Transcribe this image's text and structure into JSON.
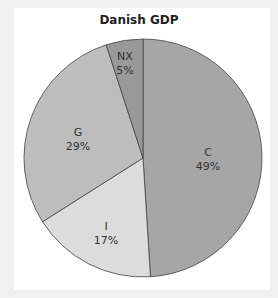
{
  "chart_data": {
    "type": "pie",
    "title": "Danish GDP",
    "categories": [
      "C",
      "I",
      "G",
      "NX"
    ],
    "values": [
      49,
      17,
      29,
      5
    ],
    "labels": [
      "C 49%",
      "I 17%",
      "G 29%",
      "NX 5%"
    ],
    "colors": {
      "C": "#a6a6a6",
      "I": "#dcdcdc",
      "G": "#bdbdbd",
      "NX": "#999999"
    },
    "start_angle": "12 o'clock, clockwise",
    "legend": "none (inline labels)"
  },
  "title": "Danish GDP",
  "slices": [
    {
      "name": "C",
      "pct": "49%"
    },
    {
      "name": "I",
      "pct": "17%"
    },
    {
      "name": "G",
      "pct": "29%"
    },
    {
      "name": "NX",
      "pct": "5%"
    }
  ]
}
